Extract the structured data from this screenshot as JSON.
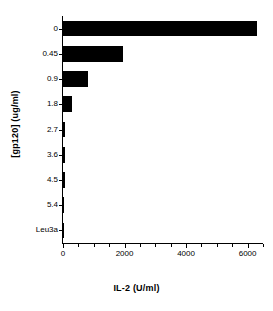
{
  "chart_data": {
    "type": "bar",
    "orientation": "horizontal",
    "title": "",
    "xlabel": "IL-2 (U/ml)",
    "ylabel": "[gp120]  (ug/ml)",
    "categories": [
      "0",
      "0.45",
      "0.9",
      "1.8",
      "2.7",
      "3.6",
      "4.5",
      "5.4",
      "Leu3a"
    ],
    "values": [
      6300,
      1950,
      800,
      300,
      75,
      70,
      55,
      15,
      10
    ],
    "xlim": [
      0,
      6500
    ],
    "xticks": [
      0,
      2000,
      4000,
      6000
    ],
    "xtick_labels": [
      "0",
      "2000",
      "4000",
      "6000"
    ],
    "xminor_step": 500,
    "grid": false,
    "legend": false,
    "bar_color": "#000000",
    "axis_color": "#000000"
  }
}
